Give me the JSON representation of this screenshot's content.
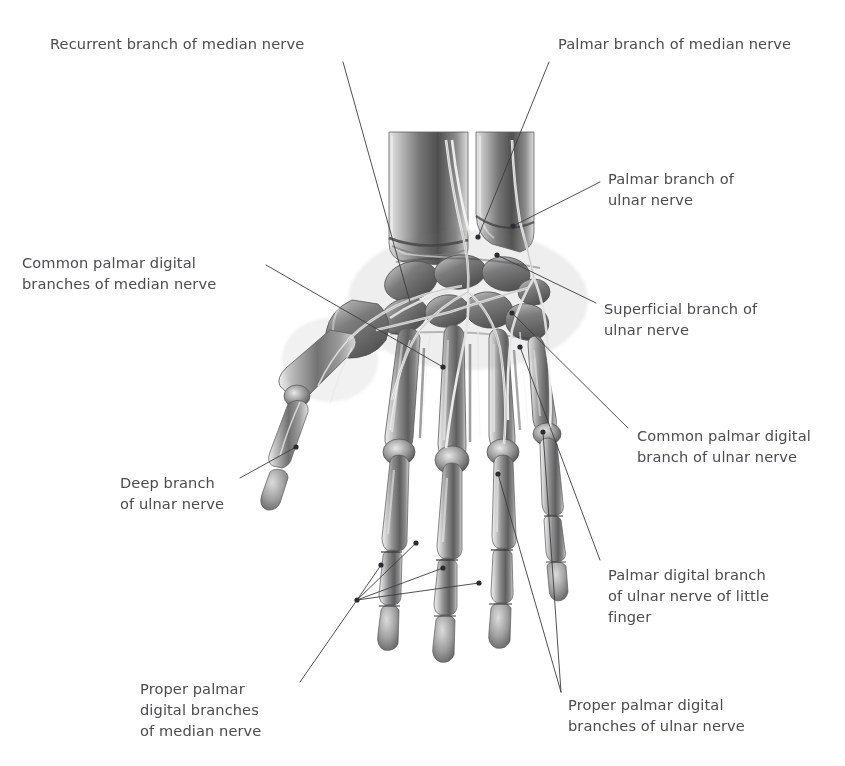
{
  "figure": {
    "background_color": "#ffffff",
    "label_color": "#4b4b50",
    "leader_color": "#3c3c42",
    "illustration": {
      "name": "hand-skeleton-with-nerves",
      "style": "graphite pencil anatomical drawing",
      "view": "palmar (anterior) view of right hand",
      "bones": [
        "radius",
        "ulna",
        "scaphoid",
        "lunate",
        "triquetrum",
        "pisiform",
        "trapezium",
        "trapezoid",
        "capitate",
        "hamate",
        "metacarpal I",
        "metacarpal II",
        "metacarpal III",
        "metacarpal IV",
        "metacarpal V",
        "proximal phalanges",
        "middle phalanges",
        "distal phalanges"
      ],
      "nerves_drawn": [
        "median nerve",
        "ulnar nerve"
      ]
    }
  },
  "labels": [
    {
      "id": "recurrent-branch-median",
      "text": "Recurrent branch of median nerve",
      "align": "left",
      "x": 50,
      "y": 33,
      "width": 300
    },
    {
      "id": "palmar-branch-median",
      "text": "Palmar branch of median nerve",
      "align": "left",
      "x": 558,
      "y": 33,
      "width": 280
    },
    {
      "id": "palmar-branch-ulnar",
      "text": "Palmar branch of\nulnar nerve",
      "align": "left",
      "x": 608,
      "y": 168,
      "width": 230
    },
    {
      "id": "common-palmar-digital-median",
      "text": "Common palmar digital\nbranches of median nerve",
      "align": "left",
      "x": 22,
      "y": 252,
      "width": 240
    },
    {
      "id": "superficial-branch-ulnar",
      "text": "Superficial branch of\nulnar nerve",
      "align": "left",
      "x": 604,
      "y": 298,
      "width": 230
    },
    {
      "id": "common-palmar-digital-ulnar",
      "text": "Common palmar digital\nbranch of ulnar nerve",
      "align": "left",
      "x": 637,
      "y": 425,
      "width": 205
    },
    {
      "id": "deep-branch-ulnar",
      "text": "Deep branch\nof ulnar nerve",
      "align": "left",
      "x": 120,
      "y": 472,
      "width": 180
    },
    {
      "id": "palmar-digital-branch-ulnar-little-finger",
      "text": "Palmar digital branch\nof ulnar nerve of little\nfinger",
      "align": "left",
      "x": 608,
      "y": 564,
      "width": 215
    },
    {
      "id": "proper-palmar-digital-median",
      "text": "Proper palmar\ndigital branches\nof median nerve",
      "align": "left",
      "x": 140,
      "y": 678,
      "width": 190
    },
    {
      "id": "proper-palmar-digital-ulnar",
      "text": "Proper palmar digital\nbranches of ulnar nerve",
      "align": "left",
      "x": 568,
      "y": 694,
      "width": 235
    }
  ],
  "leaders": [
    {
      "id": "leader-recurrent-branch-median",
      "points": "343,62 410,302"
    },
    {
      "id": "leader-palmar-branch-median",
      "points": "549,62 478,237"
    },
    {
      "id": "leader-palmar-branch-ulnar",
      "points": "600,182 513,226"
    },
    {
      "id": "leader-common-palmar-digital-median",
      "points": "266,265 443,367"
    },
    {
      "id": "leader-superficial-branch-ulnar",
      "points": "596,303 497,255"
    },
    {
      "id": "leader-common-palmar-digital-ulnar",
      "points": "628,428 512,313"
    },
    {
      "id": "leader-deep-branch-ulnar",
      "points": "240,478 296,447"
    },
    {
      "id": "leader-palmar-digital-ulnar-little",
      "points": "600,560 520,347"
    },
    {
      "id": "leader-proper-palmar-digital-median-main",
      "points": "300,682 357,600"
    },
    {
      "id": "leader-proper-palmar-digital-median-f1",
      "points": "357,600 381,565"
    },
    {
      "id": "leader-proper-palmar-digital-median-f2",
      "points": "357,600 416,543"
    },
    {
      "id": "leader-proper-palmar-digital-median-f3",
      "points": "357,600 443,568"
    },
    {
      "id": "leader-proper-palmar-digital-median-f4",
      "points": "357,600 479,583"
    },
    {
      "id": "leader-proper-palmar-digital-ulnar-main",
      "points": "561,692 498,474"
    },
    {
      "id": "leader-proper-palmar-digital-ulnar-b",
      "points": "561,692 543,432"
    }
  ],
  "markers": [
    {
      "id": "marker-palmar-branch-median",
      "x": 478,
      "y": 237
    },
    {
      "id": "marker-palmar-branch-ulnar",
      "x": 513,
      "y": 226
    },
    {
      "id": "marker-superficial-branch-ulnar",
      "x": 497,
      "y": 255
    },
    {
      "id": "marker-common-palmar-digital-ulnar",
      "x": 512,
      "y": 313
    },
    {
      "id": "marker-common-palmar-digital-median",
      "x": 443,
      "y": 367
    },
    {
      "id": "marker-palmar-digital-ulnar-little",
      "x": 520,
      "y": 347
    },
    {
      "id": "marker-deep-branch-ulnar",
      "x": 296,
      "y": 447
    },
    {
      "id": "marker-ulnar-ring-upper",
      "x": 543,
      "y": 432
    },
    {
      "id": "marker-ulnar-middle",
      "x": 498,
      "y": 474
    },
    {
      "id": "marker-median-index",
      "x": 381,
      "y": 565
    },
    {
      "id": "marker-median-hub",
      "x": 357,
      "y": 600
    },
    {
      "id": "marker-median-f2",
      "x": 416,
      "y": 543
    },
    {
      "id": "marker-median-f3",
      "x": 443,
      "y": 568
    },
    {
      "id": "marker-median-f4",
      "x": 479,
      "y": 583
    }
  ]
}
